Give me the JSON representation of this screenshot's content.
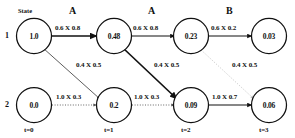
{
  "diagram": {
    "title_label": "State",
    "row_labels": [
      "1",
      "2"
    ],
    "time_labels": [
      "t=0",
      "t=1",
      "t=2",
      "t=3"
    ],
    "action_labels": [
      "A",
      "A",
      "B"
    ],
    "nodes": [
      {
        "id": "s1t0",
        "state": 1,
        "time": 0,
        "value": "1.0"
      },
      {
        "id": "s1t1",
        "state": 1,
        "time": 1,
        "value": "0.48"
      },
      {
        "id": "s1t2",
        "state": 1,
        "time": 2,
        "value": "0.23"
      },
      {
        "id": "s1t3",
        "state": 1,
        "time": 3,
        "value": "0.03"
      },
      {
        "id": "s2t0",
        "state": 2,
        "time": 0,
        "value": "0.0"
      },
      {
        "id": "s2t1",
        "state": 2,
        "time": 1,
        "value": "0.2"
      },
      {
        "id": "s2t2",
        "state": 2,
        "time": 2,
        "value": "0.09"
      },
      {
        "id": "s2t3",
        "state": 2,
        "time": 3,
        "value": "0.06"
      }
    ],
    "edges": [
      {
        "id": "e-s1t0-s1t1",
        "from": "s1t0",
        "to": "s1t1",
        "label": "0.6 X 0.8",
        "style": "bold"
      },
      {
        "id": "e-s1t1-s1t2",
        "from": "s1t1",
        "to": "s1t2",
        "label": "0.6 X 0.8",
        "style": "solid"
      },
      {
        "id": "e-s1t2-s1t3",
        "from": "s1t2",
        "to": "s1t3",
        "label": "0.6 X 0.2",
        "style": "solid"
      },
      {
        "id": "e-s1t0-s2t1",
        "from": "s1t0",
        "to": "s2t1",
        "label": "0.4 X 0.5",
        "style": "thin"
      },
      {
        "id": "e-s1t1-s2t2",
        "from": "s1t1",
        "to": "s2t2",
        "label": "0.4 X 0.5",
        "style": "bold"
      },
      {
        "id": "e-s1t2-s2t3",
        "from": "s1t2",
        "to": "s2t3",
        "label": "0.4 X 0.5",
        "style": "faint"
      },
      {
        "id": "e-s2t0-s2t1",
        "from": "s2t0",
        "to": "s2t1",
        "label": "1.0 X 0.3",
        "style": "dotted"
      },
      {
        "id": "e-s2t1-s2t2",
        "from": "s2t1",
        "to": "s2t2",
        "label": "1.0 X 0.3",
        "style": "dotted"
      },
      {
        "id": "e-s2t2-s2t3",
        "from": "s2t2",
        "to": "s2t3",
        "label": "1.0 X 0.7",
        "style": "solid"
      }
    ],
    "colors": {
      "background": "#ffffff",
      "stroke": "#111111",
      "faint_stroke": "#bdbdbd",
      "text": "#111111"
    }
  }
}
